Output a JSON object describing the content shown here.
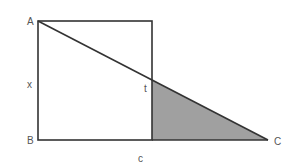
{
  "diagram": {
    "type": "geometry",
    "colors": {
      "stroke": "#333333",
      "shade": "#a0a0a0",
      "label": "#555555",
      "background": "#ffffff"
    },
    "points": {
      "A": {
        "x": 38,
        "y": 21
      },
      "B": {
        "x": 38,
        "y": 140
      },
      "square_top_right": {
        "x": 152,
        "y": 21
      },
      "square_bottom_right": {
        "x": 152,
        "y": 140
      },
      "t": {
        "x": 152,
        "y": 80
      },
      "C": {
        "x": 268,
        "y": 140
      }
    },
    "labels": {
      "A": "A",
      "B": "B",
      "C": "C",
      "x": "x",
      "t": "t",
      "c": "c"
    }
  }
}
